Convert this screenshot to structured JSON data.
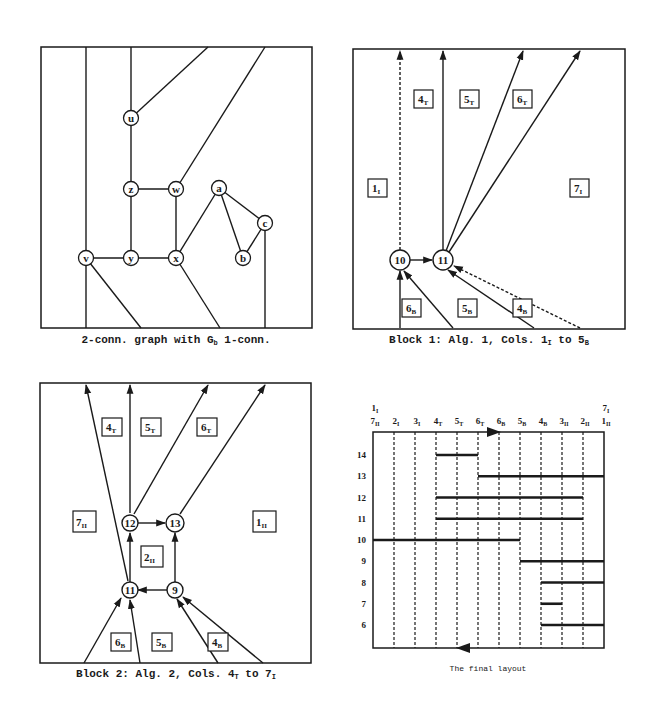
{
  "figure": {
    "panels": [
      {
        "id": "panel-graph",
        "caption": {
          "pre": "2-conn. graph with G",
          "sub": "b",
          "post": " 1-conn."
        },
        "nodes": [
          {
            "id": "u",
            "label": "u"
          },
          {
            "id": "z",
            "label": "z"
          },
          {
            "id": "w",
            "label": "w"
          },
          {
            "id": "a",
            "label": "a"
          },
          {
            "id": "c",
            "label": "c"
          },
          {
            "id": "v",
            "label": "v"
          },
          {
            "id": "y",
            "label": "y"
          },
          {
            "id": "x",
            "label": "x"
          },
          {
            "id": "b",
            "label": "b"
          }
        ]
      },
      {
        "id": "panel-block1",
        "caption": {
          "pre": "Block 1: Alg. 1, Cols. 1",
          "sub1": "I",
          "mid": " to 5",
          "sub2": "B"
        },
        "nodes": [
          {
            "label": "10"
          },
          {
            "label": "11"
          }
        ],
        "faces": [
          {
            "n": "4",
            "s": "T"
          },
          {
            "n": "5",
            "s": "T"
          },
          {
            "n": "6",
            "s": "T"
          },
          {
            "n": "1",
            "s": "I"
          },
          {
            "n": "7",
            "s": "I"
          },
          {
            "n": "6",
            "s": "B"
          },
          {
            "n": "5",
            "s": "B"
          },
          {
            "n": "4",
            "s": "B"
          }
        ]
      },
      {
        "id": "panel-block2",
        "caption": {
          "pre": "Block 2: Alg. 2, Cols. 4",
          "sub1": "T",
          "mid": " to 7",
          "sub2": "I"
        },
        "nodes": [
          {
            "label": "12"
          },
          {
            "label": "13"
          },
          {
            "label": "11"
          },
          {
            "label": "9"
          }
        ],
        "faces": [
          {
            "n": "4",
            "s": "T"
          },
          {
            "n": "5",
            "s": "T"
          },
          {
            "n": "6",
            "s": "T"
          },
          {
            "n": "7",
            "s": "II"
          },
          {
            "n": "1",
            "s": "II"
          },
          {
            "n": "2",
            "s": "II"
          },
          {
            "n": "6",
            "s": "B"
          },
          {
            "n": "5",
            "s": "B"
          },
          {
            "n": "4",
            "s": "B"
          }
        ]
      },
      {
        "id": "panel-layout",
        "caption": "The final layout",
        "top_extra": [
          {
            "n": "1",
            "s": "I",
            "col": 0
          },
          {
            "n": "7",
            "s": "I",
            "col": 11
          }
        ],
        "columns": [
          {
            "n": "7",
            "s": "II"
          },
          {
            "n": "2",
            "s": "I"
          },
          {
            "n": "3",
            "s": "I"
          },
          {
            "n": "4",
            "s": "T"
          },
          {
            "n": "5",
            "s": "T"
          },
          {
            "n": "6",
            "s": "T"
          },
          {
            "n": "6",
            "s": "B"
          },
          {
            "n": "5",
            "s": "B"
          },
          {
            "n": "4",
            "s": "B"
          },
          {
            "n": "3",
            "s": "II"
          },
          {
            "n": "2",
            "s": "II"
          },
          {
            "n": "1",
            "s": "II"
          }
        ],
        "rows": [
          "14",
          "13",
          "12",
          "11",
          "10",
          "9",
          "8",
          "7",
          "6"
        ],
        "segments": [
          {
            "row": "14",
            "from": 3,
            "to": 5
          },
          {
            "row": "13",
            "from": 5,
            "to": 11
          },
          {
            "row": "12",
            "from": 3,
            "to": 10
          },
          {
            "row": "11",
            "from": 3,
            "to": 10
          },
          {
            "row": "10",
            "from": 0,
            "to": 7
          },
          {
            "row": "9",
            "from": 7,
            "to": 11
          },
          {
            "row": "8",
            "from": 8,
            "to": 11
          },
          {
            "row": "7",
            "from": 8,
            "to": 9
          },
          {
            "row": "6",
            "from": 8,
            "to": 11
          }
        ]
      }
    ]
  }
}
